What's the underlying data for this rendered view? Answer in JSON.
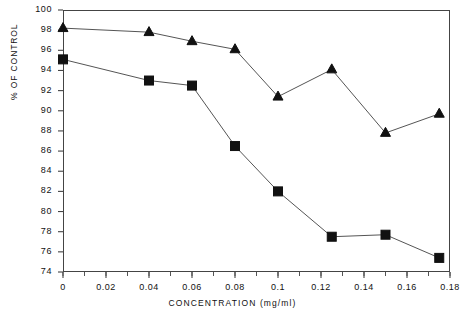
{
  "chart_data": {
    "type": "line",
    "title": "",
    "xlabel": "CONCENTRATION (mg/ml)",
    "ylabel": "% OF CONTROL",
    "xlim": [
      0,
      0.18
    ],
    "ylim": [
      74,
      100
    ],
    "grid": false,
    "legend": "none",
    "xticks": [
      "0",
      "0.02",
      "0.04",
      "0.06",
      "0.08",
      "0.1",
      "0.12",
      "0.14",
      "0.16",
      "0.18"
    ],
    "xtick_values": [
      0,
      0.02,
      0.04,
      0.06,
      0.08,
      0.1,
      0.12,
      0.14,
      0.16,
      0.18
    ],
    "xminor_step": 0.01,
    "yticks": [
      "74",
      "76",
      "78",
      "80",
      "82",
      "84",
      "86",
      "88",
      "90",
      "92",
      "94",
      "96",
      "98",
      "100"
    ],
    "ytick_values": [
      74,
      76,
      78,
      80,
      82,
      84,
      86,
      88,
      90,
      92,
      94,
      96,
      98,
      100
    ],
    "series": [
      {
        "name": "triangle-series",
        "marker": "triangle",
        "color": "#111111",
        "x": [
          0,
          0.04,
          0.06,
          0.08,
          0.1,
          0.125,
          0.15,
          0.175
        ],
        "values": [
          98.2,
          97.8,
          96.9,
          96.1,
          91.4,
          94.1,
          87.8,
          89.7
        ]
      },
      {
        "name": "square-series",
        "marker": "square",
        "color": "#111111",
        "x": [
          0,
          0.04,
          0.06,
          0.08,
          0.1,
          0.125,
          0.15,
          0.175
        ],
        "values": [
          95.1,
          93.0,
          92.5,
          86.5,
          82.0,
          77.5,
          77.7,
          75.4
        ]
      }
    ]
  }
}
